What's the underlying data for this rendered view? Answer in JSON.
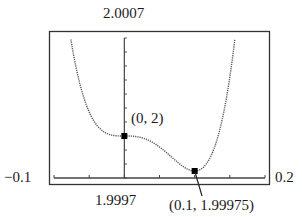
{
  "chart_data": {
    "type": "line",
    "title": "",
    "function": "f(x) = 2 + 7.5x^4 - x^3 (approx.)",
    "window": {
      "xmin": -0.1,
      "xmax": 0.2,
      "ymin": 1.9997,
      "ymax": 2.0007
    },
    "labels": {
      "ymax": "2.0007",
      "ymin": "1.9997",
      "xmin": "−0.1",
      "xmax": "0.2"
    },
    "points": [
      {
        "x": 0,
        "y": 2,
        "label": "(0, 2)"
      },
      {
        "x": 0.1,
        "y": 1.99975,
        "label": "(0.1, 1.99975)"
      }
    ],
    "xtick_step": 0.05,
    "ytick_step": 0.0001,
    "grid": false,
    "legend": null,
    "colors": {
      "curve": "#555555",
      "axes": "#444444",
      "frame": "#333333",
      "point": "#000000"
    }
  }
}
